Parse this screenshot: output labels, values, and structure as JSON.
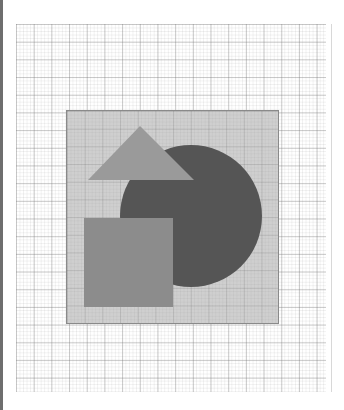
{
  "figure": {
    "background": "#ffffff",
    "grid": {
      "major_spacing_px": 17.7,
      "minor_spacing_px": 3.54,
      "line_color": "#9a9a9a"
    },
    "panel": {
      "x": 66,
      "y": 110,
      "width": 213,
      "height": 214,
      "fill": "#cfcfcf",
      "stroke": "#8a8a8a"
    },
    "shapes": [
      {
        "type": "circle",
        "name": "dark-circle",
        "cx": 191,
        "cy": 216,
        "r": 71,
        "fill": "#555555"
      },
      {
        "type": "triangle",
        "name": "triangle",
        "points": [
          [
            140,
            126
          ],
          [
            194,
            180
          ],
          [
            88,
            180
          ]
        ],
        "fill": "#9a9a9a"
      },
      {
        "type": "square",
        "name": "square",
        "x": 84,
        "y": 218,
        "width": 89,
        "height": 89,
        "fill": "#8c8c8c"
      }
    ]
  }
}
